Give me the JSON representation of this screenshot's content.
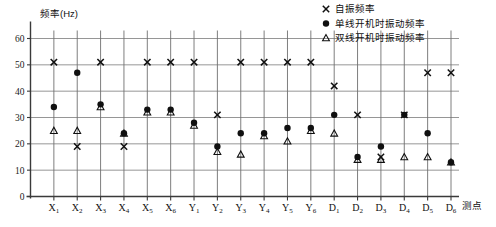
{
  "chart_data": {
    "type": "scatter",
    "title": "",
    "ylabel": "频率(Hz)",
    "xlabel": "测点",
    "ylim": [
      0,
      60
    ],
    "yticks": [
      0,
      10,
      20,
      30,
      40,
      50,
      60
    ],
    "grid": true,
    "legend_position": "top-right",
    "categories": [
      "X1",
      "X2",
      "X3",
      "X4",
      "X5",
      "X6",
      "Y1",
      "Y2",
      "Y3",
      "Y4",
      "Y5",
      "Y6",
      "D1",
      "D2",
      "D3",
      "D4",
      "D5",
      "D6"
    ],
    "category_labels": [
      {
        "base": "X",
        "sub": "1"
      },
      {
        "base": "X",
        "sub": "2"
      },
      {
        "base": "X",
        "sub": "3"
      },
      {
        "base": "X",
        "sub": "4"
      },
      {
        "base": "X",
        "sub": "5"
      },
      {
        "base": "X",
        "sub": "6"
      },
      {
        "base": "Y",
        "sub": "1"
      },
      {
        "base": "Y",
        "sub": "2"
      },
      {
        "base": "Y",
        "sub": "3"
      },
      {
        "base": "Y",
        "sub": "4"
      },
      {
        "base": "Y",
        "sub": "5"
      },
      {
        "base": "Y",
        "sub": "6"
      },
      {
        "base": "D",
        "sub": "1"
      },
      {
        "base": "D",
        "sub": "2"
      },
      {
        "base": "D",
        "sub": "3"
      },
      {
        "base": "D",
        "sub": "4"
      },
      {
        "base": "D",
        "sub": "5"
      },
      {
        "base": "D",
        "sub": "6"
      }
    ],
    "series": [
      {
        "name": "自振频率",
        "marker": "cross",
        "color": "#101010",
        "values": [
          51,
          19,
          51,
          19,
          51,
          51,
          51,
          31,
          51,
          51,
          51,
          51,
          42,
          31,
          15,
          31,
          47,
          47
        ]
      },
      {
        "name": "单线开机时振动频率",
        "marker": "circle",
        "color": "#101010",
        "values": [
          34,
          47,
          35,
          24,
          33,
          33,
          28,
          19,
          24,
          24,
          26,
          26,
          31,
          15,
          19,
          31,
          24,
          13
        ]
      },
      {
        "name": "双线开机时振动频率",
        "marker": "triangle",
        "color": "#101010",
        "values": [
          25,
          25,
          34,
          24,
          32,
          32,
          27,
          17,
          16,
          23,
          21,
          25,
          24,
          14,
          14,
          15,
          15,
          13
        ]
      }
    ]
  },
  "legend": {
    "items": [
      {
        "label": "自振频率",
        "marker": "cross"
      },
      {
        "label": "单线开机时振动频率",
        "marker": "circle"
      },
      {
        "label": "双线开机时振动频率",
        "marker": "triangle"
      }
    ]
  },
  "axes": {
    "y_title": "频率(Hz)",
    "x_title": "测点"
  }
}
